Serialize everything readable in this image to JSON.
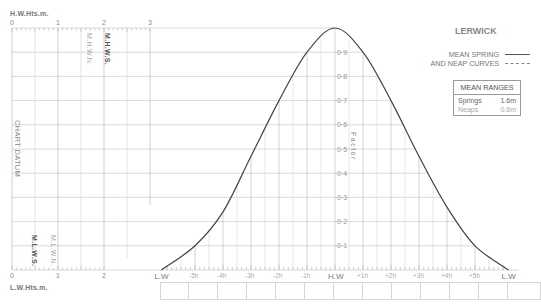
{
  "station": "LERWICK",
  "legend": {
    "line1": "MEAN SPRING",
    "line2": "AND NEAP CURVES",
    "solid_label": "spring-solid",
    "dashed_label": "neap-dashed"
  },
  "mean_ranges": {
    "title": "MEAN RANGES",
    "springs_label": "Springs",
    "springs_value": "1.6m",
    "neaps_label": "Neaps",
    "neaps_value": "0.8m"
  },
  "left_panel": {
    "top_title": "H.W.Hts.m.",
    "bottom_title": "L.W.Hts.m.",
    "top_ticks": [
      "0",
      "1",
      "2",
      "3"
    ],
    "bottom_ticks": [
      "0",
      "1",
      "2"
    ],
    "chart_datum": "CHART DATUM",
    "mhws": "M.H.W.S.",
    "mhwn": "M.H.W.N.",
    "mlws": "M.L.W.S.",
    "mlwn": "M.L.W.N."
  },
  "factor_label": "Factor",
  "time_labels": [
    "L.W",
    "-5h",
    "-4h",
    "-3h",
    "-2h",
    "-1h",
    "H.W",
    "+1h",
    "+2h",
    "+3h",
    "+4h",
    "+5h",
    "L.W"
  ],
  "chart_data": {
    "type": "line",
    "title": "LERWICK",
    "xlabel": "Hours relative to High Water",
    "ylabel": "Factor",
    "x": [
      -6.2,
      -5,
      -4,
      -3,
      -2,
      -1,
      0,
      1,
      2,
      3,
      4,
      5,
      6.2
    ],
    "series": [
      {
        "name": "Mean Spring",
        "style": "solid",
        "values": [
          0.0,
          0.1,
          0.24,
          0.47,
          0.7,
          0.9,
          1.0,
          0.9,
          0.7,
          0.47,
          0.26,
          0.1,
          0.0
        ]
      }
    ],
    "yticks": [
      0.1,
      0.2,
      0.3,
      0.4,
      0.5,
      0.6,
      0.7,
      0.8,
      0.9
    ],
    "xtick_labels": [
      "L.W",
      "-5h",
      "-4h",
      "-3h",
      "-2h",
      "-1h",
      "H.W",
      "+1h",
      "+2h",
      "+3h",
      "+4h",
      "+5h",
      "L.W"
    ],
    "ylim": [
      0,
      1
    ],
    "grid": true,
    "height_scale": {
      "hw_ticks": [
        0,
        1,
        2,
        3
      ],
      "lw_ticks": [
        0,
        1,
        2
      ],
      "unit": "m",
      "MHWS": 2.0,
      "MHWN": 1.6,
      "MLWS": 0.5,
      "MLWN": 1.0
    },
    "mean_ranges": {
      "springs": 1.6,
      "neaps": 0.8
    }
  }
}
